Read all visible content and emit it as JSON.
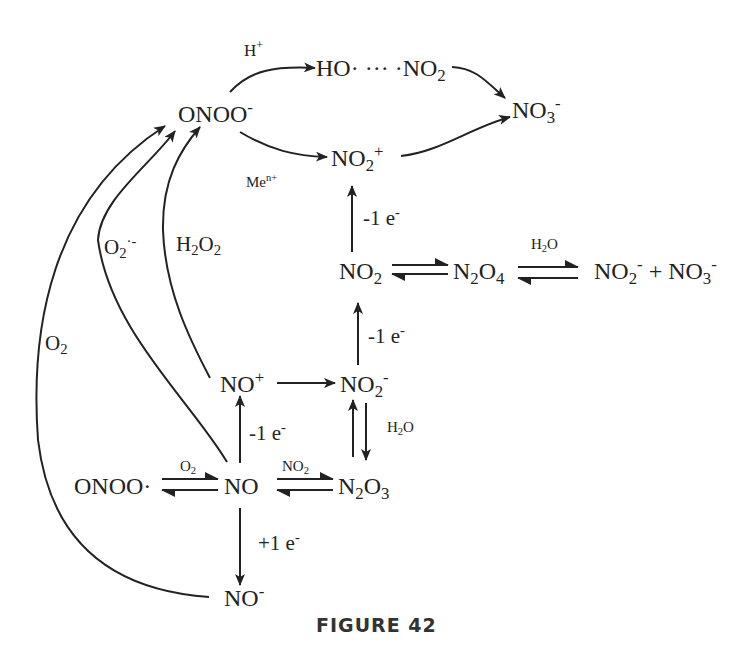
{
  "figure": {
    "caption": "FIGURE 42",
    "type": "reaction-scheme"
  },
  "species": {
    "onoo_minus": {
      "base": "ONOO",
      "sup": "-"
    },
    "ho_no2": {
      "pre": "HO· ··· ·NO",
      "sub": "2"
    },
    "no3_minus": {
      "base": "NO",
      "sub": "3",
      "sup": "-"
    },
    "no2_plus": {
      "base": "NO",
      "sub": "2",
      "sup": "+"
    },
    "no2": {
      "base": "NO",
      "sub": "2"
    },
    "n2o4": {
      "a": "N",
      "sub1": "2",
      "b": "O",
      "sub2": "4"
    },
    "products": {
      "a": "NO",
      "sub1": "2",
      "sup1": "-",
      "plus": " + NO",
      "sub2": "3",
      "sup2": "-"
    },
    "no_plus": {
      "base": "NO",
      "sup": "+"
    },
    "no2_minus": {
      "base": "NO",
      "sub": "2",
      "sup": "-"
    },
    "onoo_radical": {
      "base": "ONOO·"
    },
    "no": {
      "base": "NO"
    },
    "n2o3": {
      "a": "N",
      "sub1": "2",
      "b": "O",
      "sub2": "3"
    },
    "no_minus": {
      "base": "NO",
      "sup": "-"
    }
  },
  "conditions": {
    "h_plus": {
      "base": "H",
      "sup": "+"
    },
    "me_n_plus": {
      "base": "Me",
      "sup": "n+"
    },
    "ox_1": {
      "base": "-1 e",
      "sup": "-"
    },
    "ox_2": {
      "base": "-1 e",
      "sup": "-"
    },
    "ox_3": {
      "base": "-1 e",
      "sup": "-"
    },
    "red_1": {
      "base": "+1 e",
      "sup": "-"
    },
    "h2o_top": {
      "a": "H",
      "sub": "2",
      "b": "O"
    },
    "h2o_side": {
      "a": "H",
      "sub": "2",
      "b": "O"
    },
    "o2_curve": {
      "base": "O",
      "sub": "2"
    },
    "superoxide": {
      "base": "O",
      "sub": "2",
      "sup": "·-"
    },
    "h2o2": {
      "a": "H",
      "sub1": "2",
      "b": "O",
      "sub2": "2"
    },
    "o2_small": {
      "base": "O",
      "sub": "2"
    },
    "no2_small": {
      "base": "NO",
      "sub": "2"
    }
  },
  "colors": {
    "ink": "#222222",
    "background": "#ffffff"
  }
}
